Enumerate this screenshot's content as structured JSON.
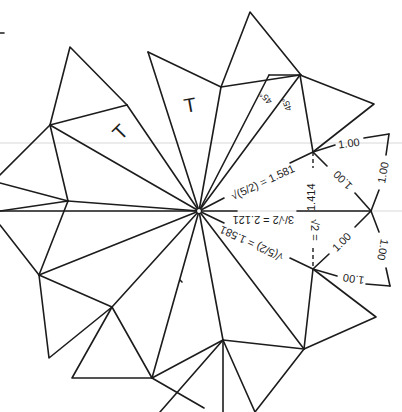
{
  "diagram": {
    "center_label": "",
    "face_labels": [
      {
        "id": "t1",
        "text": "T"
      },
      {
        "id": "t2",
        "text": "T"
      }
    ],
    "angle_labels": [
      {
        "id": "a1",
        "text": "45°"
      },
      {
        "id": "a2",
        "text": "45°"
      }
    ],
    "length_labels": {
      "upper_radial": "√(5/2) = 1.581",
      "horizontal": "3/√2 = 2.121",
      "lower_radial": "√(5/2) = 1.581",
      "vertical_upper": "1.414",
      "vertical_lower": "√2 =",
      "edges": [
        "1.00",
        "1.00",
        "1.00",
        "1.00",
        "1.00",
        "1.00"
      ]
    },
    "colors": {
      "line": "#1c1c1c",
      "background": "#ffffff",
      "faint_rule": "#d8d8d8"
    }
  }
}
